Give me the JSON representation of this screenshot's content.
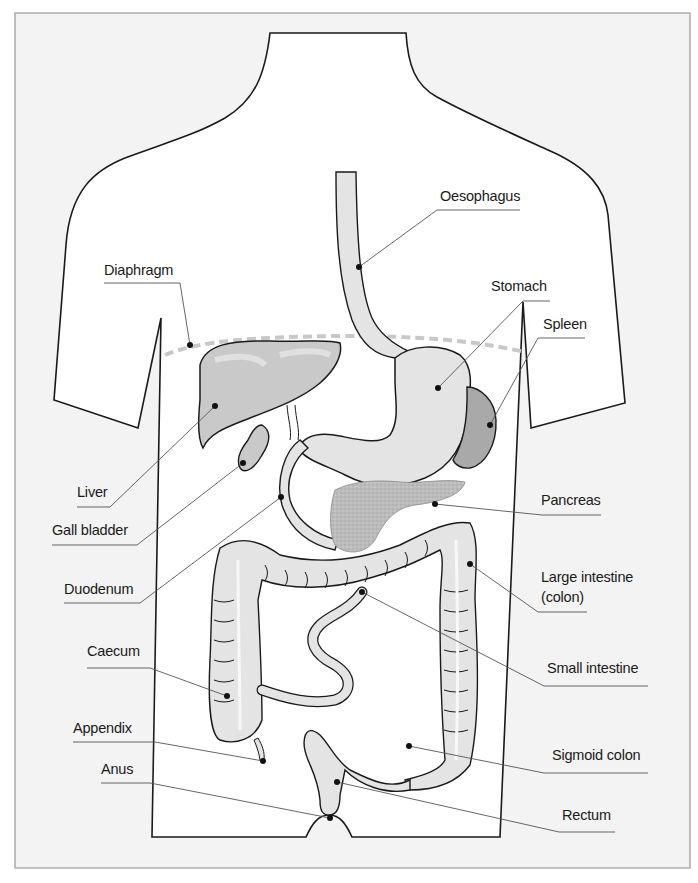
{
  "colors": {
    "frame_bg": "#f3f3f3",
    "frame_border": "#9a9a9a",
    "body_fill": "#ffffff",
    "outline": "#1a1a1a",
    "organ_fill": "#e4e4e4",
    "liver_fill": "#c9c9c9",
    "spleen_fill": "#a9a9a9",
    "pancreas_fill": "#bdbdbd",
    "diaphragm_dash": "#c8c8c8",
    "leader_line": "#555555"
  },
  "labels": [
    {
      "id": "oesophagus",
      "text": "Oesophagus",
      "x": 440,
      "y": 188
    },
    {
      "id": "diaphragm",
      "text": "Diaphragm",
      "x": 104,
      "y": 262
    },
    {
      "id": "stomach",
      "text": "Stomach",
      "x": 491,
      "y": 278
    },
    {
      "id": "spleen",
      "text": "Spleen",
      "x": 543,
      "y": 316
    },
    {
      "id": "liver",
      "text": "Liver",
      "x": 77,
      "y": 484
    },
    {
      "id": "gall_bladder",
      "text": "Gall bladder",
      "x": 52,
      "y": 522
    },
    {
      "id": "pancreas",
      "text": "Pancreas",
      "x": 541,
      "y": 492
    },
    {
      "id": "duodenum",
      "text": "Duodenum",
      "x": 64,
      "y": 581
    },
    {
      "id": "large_intestine_line1",
      "text": "Large intestine",
      "x": 541,
      "y": 569
    },
    {
      "id": "large_intestine_line2",
      "text": "(colon)",
      "x": 541,
      "y": 589
    },
    {
      "id": "caecum",
      "text": "Caecum",
      "x": 87,
      "y": 643
    },
    {
      "id": "small_intestine",
      "text": "Small intestine",
      "x": 547,
      "y": 660
    },
    {
      "id": "appendix",
      "text": "Appendix",
      "x": 73,
      "y": 720
    },
    {
      "id": "anus",
      "text": "Anus",
      "x": 101,
      "y": 761
    },
    {
      "id": "sigmoid_colon",
      "text": "Sigmoid colon",
      "x": 552,
      "y": 747
    },
    {
      "id": "rectum",
      "text": "Rectum",
      "x": 562,
      "y": 807
    }
  ]
}
